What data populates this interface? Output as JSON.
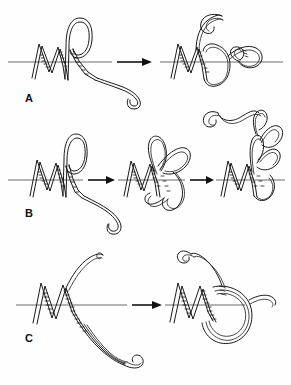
{
  "figure": {
    "background_color": "#ffffff",
    "ink_color": "#1a1a1a",
    "axis_color": "#6b6b6b",
    "width": 291,
    "height": 385
  },
  "panels": [
    {
      "id": "A",
      "label": "A",
      "label_x": 25,
      "label_y": 92,
      "axis_y": 62,
      "steps": 2,
      "description": "Single strand passage: a duplex ribbon with one large loop above the axis converts into an interlocked knotted form with a free curled tail at upper left.",
      "arrow": {
        "x1": 113,
        "y1": 62,
        "x2": 150,
        "y2": 62,
        "label": ""
      }
    },
    {
      "id": "B",
      "label": "B",
      "label_x": 25,
      "label_y": 207,
      "axis_y": 180,
      "steps": 3,
      "description": "Three-stage progression: extended ribbon with pendant tail, then crossed double-loop, then a compact multiply-wound supercoiled cluster.",
      "arrows": [
        {
          "x1": 84,
          "y1": 180,
          "x2": 116,
          "y2": 180,
          "label": ""
        },
        {
          "x1": 186,
          "y1": 180,
          "x2": 214,
          "y2": 180,
          "label": ""
        }
      ]
    },
    {
      "id": "C",
      "label": "C",
      "label_x": 25,
      "label_y": 332,
      "axis_y": 305,
      "steps": 2,
      "description": "Hairpin duplex with a long narrow paired stem folds into a closed circular loop clamped against the helical ribbon.",
      "arrow": {
        "x1": 128,
        "y1": 305,
        "x2": 163,
        "y2": 305,
        "label": ""
      }
    }
  ],
  "legend": {
    "axis_name": "helix-axis-line",
    "ribbon_name": "duplex-ribbon",
    "crossing_name": "dashed-crossing-rungs"
  }
}
